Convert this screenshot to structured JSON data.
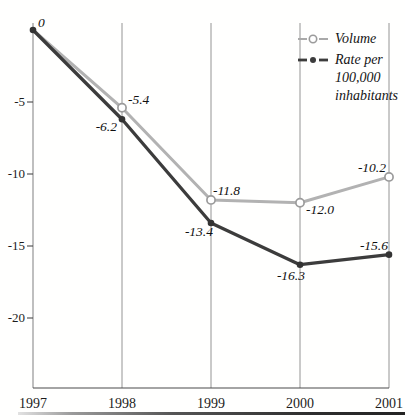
{
  "chart_data": {
    "type": "line",
    "title": "",
    "categories": [
      "1997",
      "1998",
      "1999",
      "2000",
      "2001"
    ],
    "series": [
      {
        "name": "Volume",
        "values": [
          0,
          -5.4,
          -11.8,
          -12.0,
          -10.2
        ],
        "point_labels": [
          "0",
          "-5.4",
          "-11.8",
          "-12.0",
          "-10.2"
        ],
        "color": "#b2b2b2",
        "marker": "open-circle"
      },
      {
        "name": "Rate per 100,000 inhabitants",
        "values": [
          0,
          -6.2,
          -13.4,
          -16.3,
          -15.6
        ],
        "point_labels": [
          "",
          "-6.2",
          "-13.4",
          "-16.3",
          "-15.6"
        ],
        "color": "#3c3c3c",
        "marker": "filled-circle"
      }
    ],
    "xlabel": "",
    "ylabel": "",
    "ylim": [
      -25,
      0.5
    ],
    "yticks": [
      -5,
      -10,
      -15,
      -20
    ],
    "ytick_labels": [
      "-5",
      "-10",
      "-15",
      "-20"
    ],
    "grid": "vertical-only",
    "legend_position": "top-right",
    "gridline_color": "#949494",
    "axis_color": "#4a4a4a",
    "marker_stroke_color": "#9b9b9b",
    "point_fill_color": "#333333",
    "text_color": "#1c1c1c"
  }
}
